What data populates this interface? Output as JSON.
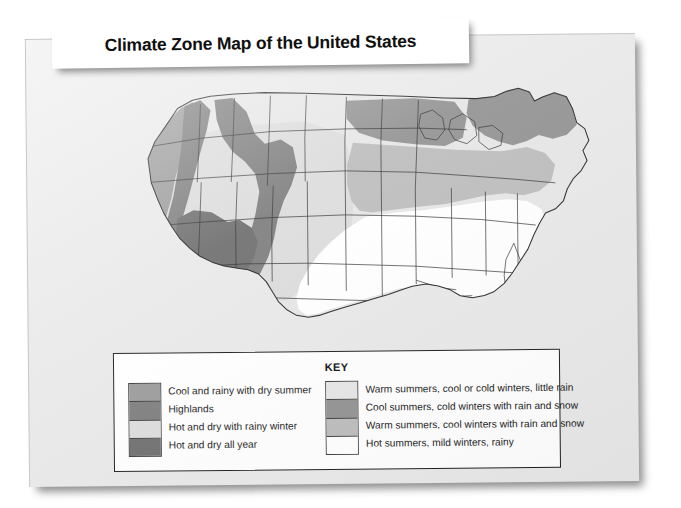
{
  "banner": {
    "title": "Climate Zone Map of the United States"
  },
  "legend": {
    "key_title": "KEY",
    "left_column": [
      {
        "label": "Cool and rainy with dry summer",
        "color": "#9b9b9b",
        "swatch_name": "swatch-cool-rainy-dry-summer"
      },
      {
        "label": "Highlands",
        "color": "#7e7e7e",
        "swatch_name": "swatch-highlands"
      },
      {
        "label": "Hot and dry with rainy winter",
        "color": "#dcdcdc",
        "swatch_name": "swatch-hot-dry-rainy-winter"
      },
      {
        "label": "Hot and dry all year",
        "color": "#6f6f6f",
        "swatch_name": "swatch-hot-dry-all-year"
      }
    ],
    "right_column": [
      {
        "label": "Warm summers, cool or cold winters, little rain",
        "color": "#e6e6e6",
        "swatch_name": "swatch-warm-summers-little-rain"
      },
      {
        "label": "Cool summers, cold winters with rain and snow",
        "color": "#939393",
        "swatch_name": "swatch-cool-summers-cold-winters"
      },
      {
        "label": "Warm summers, cool winters with rain and snow",
        "color": "#bdbdbd",
        "swatch_name": "swatch-warm-summers-cool-winters"
      },
      {
        "label": "Hot summers, mild winters, rainy",
        "color": "#ffffff",
        "swatch_name": "swatch-hot-summers-mild-winters"
      }
    ]
  },
  "map": {
    "title": "United States climate zones",
    "colors": {
      "cool_rainy_dry_summer": "#9b9b9b",
      "highlands": "#7e7e7e",
      "hot_dry_rainy_winter": "#dcdcdc",
      "hot_dry_all_year": "#6f6f6f",
      "warm_summers_little_rain": "#e6e6e6",
      "cool_summers_cold_winters": "#939393",
      "warm_summers_cool_winters": "#bdbdbd",
      "hot_summers_mild_winters": "#ffffff",
      "border": "#2f2f2f"
    },
    "regions": [
      {
        "name": "pacific-northwest-coast",
        "zone": "cool_rainy_dry_summer"
      },
      {
        "name": "rocky-mountain-highlands",
        "zone": "highlands"
      },
      {
        "name": "southwest-desert",
        "zone": "hot_dry_all_year"
      },
      {
        "name": "california-interior",
        "zone": "hot_dry_rainy_winter"
      },
      {
        "name": "great-plains",
        "zone": "warm_summers_little_rain"
      },
      {
        "name": "northern-tier",
        "zone": "cool_summers_cold_winters"
      },
      {
        "name": "midwest-mid-atlantic",
        "zone": "warm_summers_cool_winters"
      },
      {
        "name": "southeast-gulf",
        "zone": "hot_summers_mild_winters"
      }
    ]
  }
}
